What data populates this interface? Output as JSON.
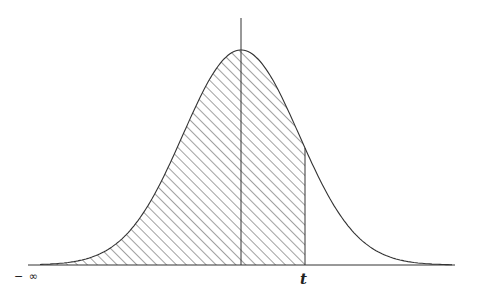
{
  "diagram": {
    "type": "normal-distribution-cumulative-area",
    "labels": {
      "left_limit": "− ∞",
      "upper_bound": "t"
    },
    "shaded_region": "area under curve from −∞ to t (hatched)",
    "colors": {
      "line": "#333333",
      "hatch": "#444444",
      "background": "#ffffff"
    }
  }
}
